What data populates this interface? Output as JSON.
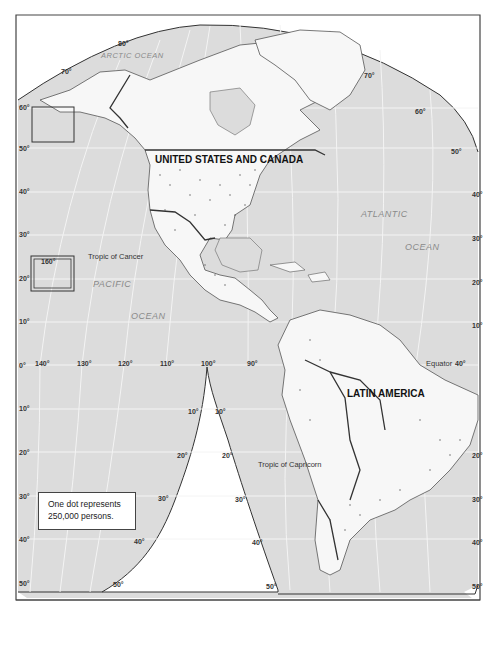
{
  "colors": {
    "ocean": "#dcdcdc",
    "land": "#f7f7f7",
    "border": "#333333",
    "graticule": "#f2f2f2",
    "frame": "#444444"
  },
  "regions": {
    "us_canada": "UNITED STATES AND CANADA",
    "latin_america": "LATIN AMERICA"
  },
  "oceans": {
    "arctic": "ARCTIC OCEAN",
    "atlantic_1": "ATLANTIC",
    "atlantic_2": "OCEAN",
    "pacific_1": "PACIFIC",
    "pacific_2": "OCEAN"
  },
  "lines": {
    "tropic_cancer": "Tropic of Cancer",
    "tropic_capricorn": "Tropic of Capricorn",
    "equator": "Equator"
  },
  "legend": {
    "line1": "One dot represents",
    "line2": "250,000 persons."
  },
  "inset": {
    "label": "160°"
  },
  "latitude_labels": {
    "left": [
      "60°",
      "50°",
      "40°",
      "30°",
      "20°",
      "10°",
      "0°",
      "10°",
      "20°",
      "30°",
      "40°",
      "50°"
    ],
    "right": [
      "70°",
      "60°",
      "50°",
      "40°",
      "30°",
      "20°",
      "10°",
      "20°",
      "30°",
      "40°",
      "50°"
    ],
    "top": [
      "80°",
      "70°"
    ],
    "cusp_left": [
      "10°",
      "20°",
      "30°",
      "40°",
      "50°"
    ],
    "cusp_right": [
      "10°",
      "20°",
      "30°",
      "40°",
      "50°"
    ]
  },
  "longitude_labels": [
    "140°",
    "130°",
    "120°",
    "110°",
    "100°",
    "90°",
    "40°"
  ]
}
